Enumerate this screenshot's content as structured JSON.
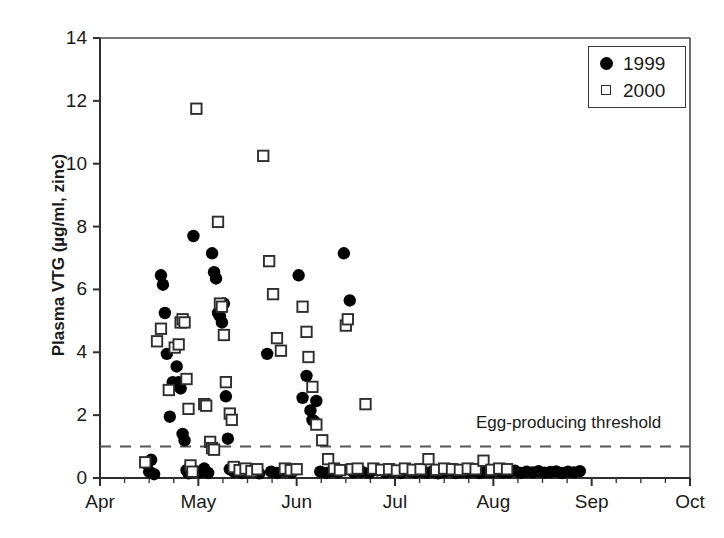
{
  "figure": {
    "background": "#ffffff",
    "ink_color": "#1a1a1a"
  },
  "chart_data": {
    "type": "scatter",
    "title": "",
    "xlabel": "",
    "ylabel": "Plasma VTG (µg/ml, zinc)",
    "ylim": [
      0,
      14
    ],
    "yticks": [
      0,
      2,
      4,
      6,
      8,
      10,
      12,
      14
    ],
    "ytick_labels": [
      "0",
      "2",
      "4",
      "6",
      "8",
      "10",
      "12",
      "14"
    ],
    "xlim": [
      "Apr",
      "Oct"
    ],
    "xticks": [
      "Apr",
      "May",
      "Jun",
      "Jul",
      "Aug",
      "Sep",
      "Oct"
    ],
    "xtick_labels": [
      "Apr",
      "May",
      "Jun",
      "Jul",
      "Aug",
      "Sep",
      "Oct"
    ],
    "x_minor_ticks_per_month": 4,
    "grid": false,
    "legend_position": "top-right",
    "legend": [
      {
        "label": "1999",
        "marker": "filled-circle",
        "color": "#000000"
      },
      {
        "label": "2000",
        "marker": "open-square",
        "color": "#ffffff",
        "edge": "#2e2e2e"
      }
    ],
    "annotations": [
      {
        "text": "Egg-producing threshold",
        "type": "threshold-line-label",
        "y_value": 1.0,
        "line_style": "dashed",
        "line_color": "#555555"
      }
    ],
    "series": [
      {
        "name": "1999",
        "marker": "filled-circle",
        "points": [
          [
            0.48,
            0.45
          ],
          [
            0.5,
            0.2
          ],
          [
            0.52,
            0.58
          ],
          [
            0.55,
            0.12
          ],
          [
            0.62,
            6.45
          ],
          [
            0.64,
            6.15
          ],
          [
            0.66,
            5.25
          ],
          [
            0.68,
            3.95
          ],
          [
            0.71,
            1.95
          ],
          [
            0.74,
            3.05
          ],
          [
            0.76,
            2.95
          ],
          [
            0.78,
            3.55
          ],
          [
            0.8,
            3.05
          ],
          [
            0.82,
            2.85
          ],
          [
            0.84,
            1.4
          ],
          [
            0.86,
            1.2
          ],
          [
            0.88,
            0.25
          ],
          [
            0.9,
            0.15
          ],
          [
            0.95,
            7.7
          ],
          [
            0.97,
            0.22
          ],
          [
            1.02,
            0.18
          ],
          [
            1.06,
            0.3
          ],
          [
            1.1,
            0.16
          ],
          [
            1.14,
            7.15
          ],
          [
            1.16,
            6.55
          ],
          [
            1.18,
            6.35
          ],
          [
            1.2,
            5.25
          ],
          [
            1.22,
            5.15
          ],
          [
            1.24,
            4.95
          ],
          [
            1.26,
            5.55
          ],
          [
            1.28,
            2.6
          ],
          [
            1.3,
            1.25
          ],
          [
            1.32,
            0.28
          ],
          [
            1.36,
            0.2
          ],
          [
            1.4,
            0.22
          ],
          [
            1.44,
            0.16
          ],
          [
            1.5,
            0.18
          ],
          [
            1.56,
            0.24
          ],
          [
            1.62,
            0.15
          ],
          [
            1.7,
            3.95
          ],
          [
            1.74,
            0.2
          ],
          [
            1.8,
            0.16
          ],
          [
            1.88,
            0.22
          ],
          [
            1.95,
            0.18
          ],
          [
            2.02,
            6.45
          ],
          [
            2.06,
            2.55
          ],
          [
            2.1,
            3.25
          ],
          [
            2.14,
            2.15
          ],
          [
            2.16,
            1.85
          ],
          [
            2.18,
            1.8
          ],
          [
            2.2,
            2.45
          ],
          [
            2.24,
            0.2
          ],
          [
            2.3,
            0.16
          ],
          [
            2.36,
            0.22
          ],
          [
            2.42,
            0.18
          ],
          [
            2.48,
            7.15
          ],
          [
            2.54,
            5.65
          ],
          [
            2.58,
            0.18
          ],
          [
            2.66,
            0.2
          ],
          [
            2.74,
            0.16
          ],
          [
            2.82,
            0.24
          ],
          [
            2.9,
            0.18
          ],
          [
            2.98,
            0.2
          ],
          [
            3.06,
            0.16
          ],
          [
            3.14,
            0.22
          ],
          [
            3.2,
            0.18
          ],
          [
            3.26,
            0.2
          ],
          [
            3.32,
            0.17
          ],
          [
            3.38,
            0.21
          ],
          [
            3.44,
            0.15
          ],
          [
            3.5,
            0.19
          ],
          [
            3.56,
            0.23
          ],
          [
            3.62,
            0.16
          ],
          [
            3.68,
            0.2
          ],
          [
            3.74,
            0.18
          ],
          [
            3.8,
            0.22
          ],
          [
            3.86,
            0.16
          ],
          [
            3.92,
            0.2
          ],
          [
            3.98,
            0.18
          ],
          [
            4.04,
            0.21
          ],
          [
            4.1,
            0.17
          ],
          [
            4.16,
            0.19
          ],
          [
            4.22,
            0.23
          ],
          [
            4.28,
            0.16
          ],
          [
            4.34,
            0.2
          ],
          [
            4.4,
            0.18
          ],
          [
            4.46,
            0.22
          ],
          [
            4.52,
            0.17
          ],
          [
            4.58,
            0.19
          ],
          [
            4.64,
            0.21
          ],
          [
            4.7,
            0.16
          ],
          [
            4.76,
            0.2
          ],
          [
            4.82,
            0.18
          ],
          [
            4.88,
            0.22
          ]
        ]
      },
      {
        "name": "2000",
        "marker": "open-square",
        "points": [
          [
            0.46,
            0.5
          ],
          [
            0.58,
            4.35
          ],
          [
            0.62,
            4.75
          ],
          [
            0.7,
            2.8
          ],
          [
            0.76,
            4.15
          ],
          [
            0.8,
            4.25
          ],
          [
            0.82,
            4.95
          ],
          [
            0.84,
            5.05
          ],
          [
            0.86,
            4.95
          ],
          [
            0.88,
            3.15
          ],
          [
            0.9,
            2.2
          ],
          [
            0.92,
            0.4
          ],
          [
            0.94,
            0.2
          ],
          [
            0.98,
            11.75
          ],
          [
            1.06,
            2.35
          ],
          [
            1.08,
            2.3
          ],
          [
            1.12,
            1.15
          ],
          [
            1.14,
            0.95
          ],
          [
            1.16,
            0.9
          ],
          [
            1.2,
            8.15
          ],
          [
            1.22,
            5.55
          ],
          [
            1.24,
            5.45
          ],
          [
            1.26,
            4.55
          ],
          [
            1.28,
            3.05
          ],
          [
            1.32,
            2.05
          ],
          [
            1.34,
            1.85
          ],
          [
            1.36,
            0.35
          ],
          [
            1.42,
            0.25
          ],
          [
            1.48,
            0.3
          ],
          [
            1.54,
            0.22
          ],
          [
            1.6,
            0.28
          ],
          [
            1.66,
            10.25
          ],
          [
            1.72,
            6.9
          ],
          [
            1.76,
            5.85
          ],
          [
            1.8,
            4.45
          ],
          [
            1.84,
            4.05
          ],
          [
            1.88,
            0.3
          ],
          [
            1.94,
            0.25
          ],
          [
            2.0,
            0.28
          ],
          [
            2.06,
            5.45
          ],
          [
            2.1,
            4.65
          ],
          [
            2.12,
            3.85
          ],
          [
            2.16,
            2.9
          ],
          [
            2.2,
            1.7
          ],
          [
            2.26,
            1.2
          ],
          [
            2.32,
            0.6
          ],
          [
            2.38,
            0.3
          ],
          [
            2.44,
            0.25
          ],
          [
            2.5,
            4.85
          ],
          [
            2.52,
            5.05
          ],
          [
            2.56,
            0.28
          ],
          [
            2.62,
            0.3
          ],
          [
            2.7,
            2.35
          ],
          [
            2.78,
            0.3
          ],
          [
            2.86,
            0.26
          ],
          [
            2.94,
            0.28
          ],
          [
            3.02,
            0.24
          ],
          [
            3.1,
            0.3
          ],
          [
            3.18,
            0.26
          ],
          [
            3.26,
            0.28
          ],
          [
            3.34,
            0.6
          ],
          [
            3.42,
            0.26
          ],
          [
            3.5,
            0.3
          ],
          [
            3.58,
            0.28
          ],
          [
            3.66,
            0.26
          ],
          [
            3.74,
            0.3
          ],
          [
            3.82,
            0.28
          ],
          [
            3.9,
            0.55
          ],
          [
            3.98,
            0.26
          ],
          [
            4.06,
            0.3
          ],
          [
            4.14,
            0.28
          ]
        ]
      }
    ]
  }
}
